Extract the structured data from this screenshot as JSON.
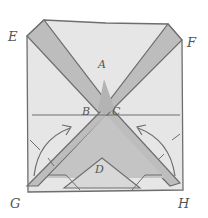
{
  "diagram": {
    "type": "origami-fold-illustration",
    "labels": {
      "E": "E",
      "F": "F",
      "A": "A",
      "B": "B",
      "C": "C",
      "D": "D",
      "G": "G",
      "H": "H"
    },
    "colors": {
      "paper_light": "#e6e6e6",
      "paper_dark": "#bdbdbd",
      "outline": "#6e6e6e",
      "background": "#ffffff"
    }
  }
}
